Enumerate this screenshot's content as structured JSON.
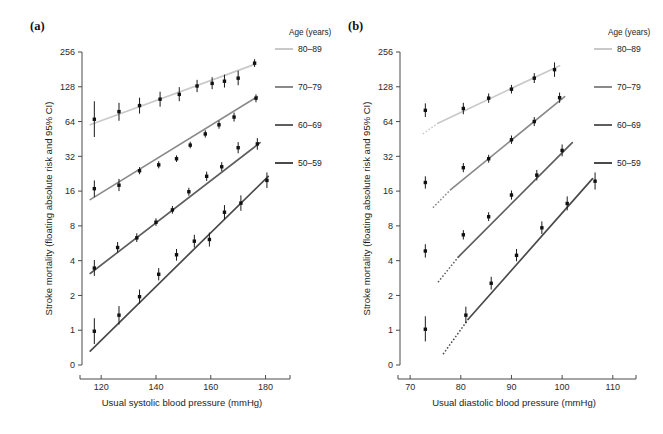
{
  "figure": {
    "panels": [
      {
        "id": "a",
        "label": "(a)",
        "xlabel": "Usual systolic blood pressure (mmHg)",
        "ylabel": "Stroke mortality (floating absolute risk and 95% CI)",
        "xticks": [
          120,
          140,
          160,
          180
        ],
        "xlim": [
          113,
          186
        ],
        "yticks": [
          0,
          1,
          2,
          4,
          8,
          16,
          32,
          64,
          128,
          256
        ]
      },
      {
        "id": "b",
        "label": "(b)",
        "xlabel": "Usual diastolic blood pressure (mmHg)",
        "ylabel": "Stroke mortality (floating absolute risk and 95% CI)",
        "xticks": [
          70,
          80,
          90,
          100,
          110
        ],
        "xlim": [
          68,
          113
        ],
        "yticks": [
          0,
          1,
          2,
          4,
          8,
          16,
          32,
          64,
          128,
          256
        ]
      }
    ],
    "legend": {
      "title": "Age (years)",
      "entries": [
        {
          "label": "80–89",
          "color": "#c9c9c9"
        },
        {
          "label": "70–79",
          "color": "#8a8a8a"
        },
        {
          "label": "60–69",
          "color": "#5e5e5e"
        },
        {
          "label": "50–59",
          "color": "#4a4a4a"
        }
      ]
    }
  },
  "chart_data": [
    {
      "type": "scatter",
      "panel": "a",
      "title": "(a) Stroke mortality rate vs usual systolic blood pressure",
      "xlabel": "Usual systolic blood pressure (mmHg)",
      "ylabel": "Stroke mortality (floating absolute risk and 95% CI)",
      "yscale": "log2",
      "xlim": [
        113,
        186
      ],
      "ylim": [
        0.55,
        300
      ],
      "xticks": [
        120,
        140,
        160,
        180
      ],
      "yticks": [
        0,
        1,
        2,
        4,
        8,
        16,
        32,
        64,
        128,
        256
      ],
      "grid": false,
      "legend_position": "right",
      "series": [
        {
          "name": "80–89",
          "color": "#c9c9c9",
          "fit_line": {
            "x": [
              116,
              176
            ],
            "y": [
              60,
              200
            ]
          },
          "points": [
            {
              "x": 117.5,
              "y": 67,
              "ci_low": 47,
              "ci_high": 96
            },
            {
              "x": 126.5,
              "y": 78,
              "ci_low": 65,
              "ci_high": 93
            },
            {
              "x": 134.0,
              "y": 88,
              "ci_low": 75,
              "ci_high": 103
            },
            {
              "x": 141.5,
              "y": 100,
              "ci_low": 86,
              "ci_high": 116
            },
            {
              "x": 148.5,
              "y": 110,
              "ci_low": 96,
              "ci_high": 127
            },
            {
              "x": 155.0,
              "y": 130,
              "ci_low": 115,
              "ci_high": 147
            },
            {
              "x": 160.5,
              "y": 137,
              "ci_low": 122,
              "ci_high": 155
            },
            {
              "x": 165.0,
              "y": 143,
              "ci_low": 126,
              "ci_high": 163
            },
            {
              "x": 170.0,
              "y": 152,
              "ci_low": 132,
              "ci_high": 176
            },
            {
              "x": 176.0,
              "y": 205,
              "ci_low": 190,
              "ci_high": 222
            }
          ]
        },
        {
          "name": "70–79",
          "color": "#8a8a8a",
          "fit_line": {
            "x": [
              116,
              177
            ],
            "y": [
              13.5,
              105
            ]
          },
          "points": [
            {
              "x": 117.5,
              "y": 16.8,
              "ci_low": 14.2,
              "ci_high": 19.8
            },
            {
              "x": 126.5,
              "y": 18.0,
              "ci_low": 16.0,
              "ci_high": 20.4
            },
            {
              "x": 134.0,
              "y": 24.0,
              "ci_low": 22.4,
              "ci_high": 25.8
            },
            {
              "x": 141.0,
              "y": 27.0,
              "ci_low": 25.2,
              "ci_high": 29.0
            },
            {
              "x": 147.5,
              "y": 30.5,
              "ci_low": 28.6,
              "ci_high": 32.6
            },
            {
              "x": 152.5,
              "y": 40.0,
              "ci_low": 37.5,
              "ci_high": 42.8
            },
            {
              "x": 158.0,
              "y": 50.0,
              "ci_low": 46.5,
              "ci_high": 53.8
            },
            {
              "x": 163.0,
              "y": 60.0,
              "ci_low": 55.5,
              "ci_high": 65.0
            },
            {
              "x": 168.5,
              "y": 70.0,
              "ci_low": 64.0,
              "ci_high": 76.5
            },
            {
              "x": 176.5,
              "y": 102.0,
              "ci_low": 94.0,
              "ci_high": 110.0
            }
          ]
        },
        {
          "name": "60–69",
          "color": "#5e5e5e",
          "fit_line": {
            "x": [
              116,
              178
            ],
            "y": [
              3.1,
              42
            ]
          },
          "points": [
            {
              "x": 117.5,
              "y": 3.45,
              "ci_low": 2.95,
              "ci_high": 4.05
            },
            {
              "x": 126.0,
              "y": 5.2,
              "ci_low": 4.7,
              "ci_high": 5.8
            },
            {
              "x": 133.0,
              "y": 6.3,
              "ci_low": 5.8,
              "ci_high": 6.9
            },
            {
              "x": 140.0,
              "y": 8.6,
              "ci_low": 8.0,
              "ci_high": 9.3
            },
            {
              "x": 146.0,
              "y": 11.0,
              "ci_low": 10.2,
              "ci_high": 11.9
            },
            {
              "x": 152.0,
              "y": 15.8,
              "ci_low": 14.6,
              "ci_high": 17.1
            },
            {
              "x": 158.5,
              "y": 21.5,
              "ci_low": 19.6,
              "ci_high": 23.6
            },
            {
              "x": 164.0,
              "y": 26.0,
              "ci_low": 23.8,
              "ci_high": 28.5
            },
            {
              "x": 170.0,
              "y": 38.0,
              "ci_low": 34.0,
              "ci_high": 42.5
            },
            {
              "x": 177.0,
              "y": 41.0,
              "ci_low": 36.5,
              "ci_high": 46.0
            }
          ]
        },
        {
          "name": "50–59",
          "color": "#4a4a4a",
          "fit_line": {
            "x": [
              116,
              181
            ],
            "y": [
              0.66,
              21.5
            ]
          },
          "points": [
            {
              "x": 117.5,
              "y": 0.98,
              "ci_low": 0.76,
              "ci_high": 1.27
            },
            {
              "x": 126.5,
              "y": 1.35,
              "ci_low": 1.12,
              "ci_high": 1.62
            },
            {
              "x": 134.0,
              "y": 1.95,
              "ci_low": 1.7,
              "ci_high": 2.25
            },
            {
              "x": 141.0,
              "y": 3.05,
              "ci_low": 2.7,
              "ci_high": 3.45
            },
            {
              "x": 147.5,
              "y": 4.5,
              "ci_low": 4.0,
              "ci_high": 5.05
            },
            {
              "x": 154.0,
              "y": 5.9,
              "ci_low": 5.2,
              "ci_high": 6.7
            },
            {
              "x": 159.5,
              "y": 6.1,
              "ci_low": 5.3,
              "ci_high": 7.0
            },
            {
              "x": 165.0,
              "y": 10.5,
              "ci_low": 9.1,
              "ci_high": 12.1
            },
            {
              "x": 171.0,
              "y": 12.6,
              "ci_low": 10.8,
              "ci_high": 14.7
            },
            {
              "x": 180.5,
              "y": 19.8,
              "ci_low": 17.0,
              "ci_high": 23.2
            }
          ]
        }
      ]
    },
    {
      "type": "scatter",
      "panel": "b",
      "title": "(b) Stroke mortality rate vs usual diastolic blood pressure",
      "xlabel": "Usual diastolic blood pressure (mmHg)",
      "ylabel": "Stroke mortality (floating absolute risk and 95% CI)",
      "yscale": "log2",
      "xlim": [
        68,
        113
      ],
      "ylim": [
        0.55,
        300
      ],
      "xticks": [
        70,
        80,
        90,
        100,
        110
      ],
      "yticks": [
        0,
        1,
        2,
        4,
        8,
        16,
        32,
        64,
        128,
        256
      ],
      "grid": false,
      "legend_position": "right",
      "series": [
        {
          "name": "80–89",
          "color": "#c9c9c9",
          "fit_line": {
            "x": [
              75.5,
              99.5
            ],
            "y": [
              62,
              195
            ]
          },
          "dotted_extension": {
            "x": [
              72.5,
              75.5
            ],
            "y": [
              50,
              62
            ]
          },
          "points": [
            {
              "x": 73.0,
              "y": 80,
              "ci_low": 70,
              "ci_high": 92
            },
            {
              "x": 80.5,
              "y": 83,
              "ci_low": 74,
              "ci_high": 93
            },
            {
              "x": 85.5,
              "y": 102,
              "ci_low": 93,
              "ci_high": 112
            },
            {
              "x": 90.0,
              "y": 122,
              "ci_low": 112,
              "ci_high": 133
            },
            {
              "x": 94.5,
              "y": 152,
              "ci_low": 138,
              "ci_high": 168
            },
            {
              "x": 98.5,
              "y": 180,
              "ci_low": 156,
              "ci_high": 208
            }
          ]
        },
        {
          "name": "70–79",
          "color": "#8a8a8a",
          "fit_line": {
            "x": [
              78.0,
              100.5
            ],
            "y": [
              16.5,
              105
            ]
          },
          "dotted_extension": {
            "x": [
              74.5,
              78.0
            ],
            "y": [
              11.5,
              16.5
            ]
          },
          "points": [
            {
              "x": 73.0,
              "y": 19.0,
              "ci_low": 16.8,
              "ci_high": 21.5
            },
            {
              "x": 80.5,
              "y": 25.5,
              "ci_low": 23.3,
              "ci_high": 28.0
            },
            {
              "x": 85.5,
              "y": 30.5,
              "ci_low": 28.2,
              "ci_high": 33.0
            },
            {
              "x": 90.0,
              "y": 44.5,
              "ci_low": 41.0,
              "ci_high": 48.5
            },
            {
              "x": 94.5,
              "y": 64.0,
              "ci_low": 58.5,
              "ci_high": 70.0
            },
            {
              "x": 99.5,
              "y": 103.0,
              "ci_low": 93.0,
              "ci_high": 114.0
            }
          ]
        },
        {
          "name": "60–69",
          "color": "#5e5e5e",
          "fit_line": {
            "x": [
              79.5,
              102.0
            ],
            "y": [
              4.3,
              42
            ]
          },
          "dotted_extension": {
            "x": [
              75.5,
              79.5
            ],
            "y": [
              2.6,
              4.3
            ]
          },
          "points": [
            {
              "x": 73.0,
              "y": 4.85,
              "ci_low": 4.25,
              "ci_high": 5.55
            },
            {
              "x": 80.5,
              "y": 6.7,
              "ci_low": 6.1,
              "ci_high": 7.35
            },
            {
              "x": 85.5,
              "y": 9.6,
              "ci_low": 8.8,
              "ci_high": 10.5
            },
            {
              "x": 90.0,
              "y": 14.8,
              "ci_low": 13.5,
              "ci_high": 16.2
            },
            {
              "x": 95.0,
              "y": 22.0,
              "ci_low": 19.8,
              "ci_high": 24.4
            },
            {
              "x": 100.0,
              "y": 36.0,
              "ci_low": 32.0,
              "ci_high": 40.5
            }
          ]
        },
        {
          "name": "50–59",
          "color": "#4a4a4a",
          "fit_line": {
            "x": [
              81.5,
              106.0
            ],
            "y": [
              1.25,
              20.5
            ]
          },
          "dotted_extension": {
            "x": [
              76.5,
              81.5
            ],
            "y": [
              0.62,
              1.25
            ]
          },
          "points": [
            {
              "x": 73.0,
              "y": 1.02,
              "ci_low": 0.8,
              "ci_high": 1.32
            },
            {
              "x": 81.0,
              "y": 1.35,
              "ci_low": 1.15,
              "ci_high": 1.6
            },
            {
              "x": 86.0,
              "y": 2.55,
              "ci_low": 2.25,
              "ci_high": 2.9
            },
            {
              "x": 91.0,
              "y": 4.45,
              "ci_low": 3.95,
              "ci_high": 5.05
            },
            {
              "x": 96.0,
              "y": 7.7,
              "ci_low": 6.8,
              "ci_high": 8.75
            },
            {
              "x": 101.0,
              "y": 12.5,
              "ci_low": 10.9,
              "ci_high": 14.4
            },
            {
              "x": 106.5,
              "y": 19.5,
              "ci_low": 16.5,
              "ci_high": 23.2
            }
          ]
        }
      ]
    }
  ]
}
